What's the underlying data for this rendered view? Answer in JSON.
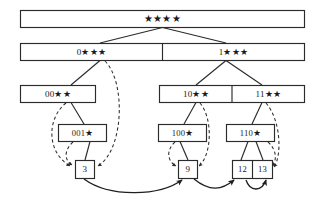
{
  "diagram": {
    "colors": {
      "stroke": "#2b2b2b",
      "fill": "#ffffff",
      "chain": "#1f1f1f",
      "background": "#ffffff"
    },
    "levels": [
      {
        "level": 0,
        "name": "root-level",
        "cells": [
          {
            "id": "root",
            "label": "★★★★"
          }
        ]
      },
      {
        "level": 1,
        "name": "level-1",
        "cells": [
          {
            "id": "n0",
            "label": "0★★★"
          },
          {
            "id": "n1",
            "label": "1★★★"
          }
        ]
      },
      {
        "level": 2,
        "name": "level-2",
        "cells": [
          {
            "id": "n00",
            "label": "00★★"
          },
          {
            "id": "n10",
            "label": "10★★"
          },
          {
            "id": "n11",
            "label": "11★★"
          }
        ]
      },
      {
        "level": 3,
        "name": "level-3",
        "cells": [
          {
            "id": "n001",
            "label": "001★"
          },
          {
            "id": "n100",
            "label": "100★"
          },
          {
            "id": "n110",
            "label": "110★"
          }
        ]
      },
      {
        "level": 4,
        "name": "leaf-level",
        "cells": [
          {
            "id": "leaf3",
            "label": "3"
          },
          {
            "id": "leaf9",
            "label": "9"
          },
          {
            "id": "leaf12",
            "label": "12"
          },
          {
            "id": "leaf13",
            "label": "13"
          }
        ]
      }
    ],
    "edges": {
      "solid": [
        {
          "from": "root",
          "to": "n0"
        },
        {
          "from": "root",
          "to": "n1"
        },
        {
          "from": "n0",
          "to": "n00"
        },
        {
          "from": "n1",
          "to": "n10"
        },
        {
          "from": "n1",
          "to": "n11"
        },
        {
          "from": "n00",
          "to": "n001"
        },
        {
          "from": "n10",
          "to": "n100"
        },
        {
          "from": "n11",
          "to": "n110"
        },
        {
          "from": "n001",
          "to": "leaf3"
        },
        {
          "from": "n100",
          "to": "leaf9"
        },
        {
          "from": "n110",
          "to": "leaf12"
        },
        {
          "from": "n110",
          "to": "leaf13"
        }
      ],
      "dashed": [
        {
          "from": "n00",
          "to": "leaf3"
        },
        {
          "from": "n001",
          "to": "leaf3"
        },
        {
          "from": "n0",
          "to": "leaf3"
        },
        {
          "from": "n100",
          "to": "leaf9"
        },
        {
          "from": "n10",
          "to": "leaf9"
        },
        {
          "from": "n110",
          "to": "leaf12"
        },
        {
          "from": "n11",
          "to": "leaf13"
        }
      ],
      "chain": [
        {
          "from": "leaf3",
          "to": "leaf9"
        },
        {
          "from": "leaf9",
          "to": "leaf12"
        },
        {
          "from": "leaf12",
          "to": "leaf13"
        }
      ]
    }
  }
}
